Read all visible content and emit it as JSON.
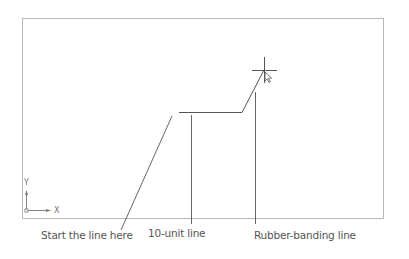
{
  "diagram": {
    "type": "cad-line-drawing-illustration",
    "callouts": [
      {
        "id": "start",
        "label": "Start the line here"
      },
      {
        "id": "ten_unit",
        "label": "10-unit line"
      },
      {
        "id": "rubber",
        "label": "Rubber-banding line"
      }
    ],
    "ucs_icon": {
      "x_label": "X",
      "y_label": "Y"
    },
    "colors": {
      "line": "#555555",
      "frame": "#b0b0b0",
      "text": "#555555"
    }
  }
}
